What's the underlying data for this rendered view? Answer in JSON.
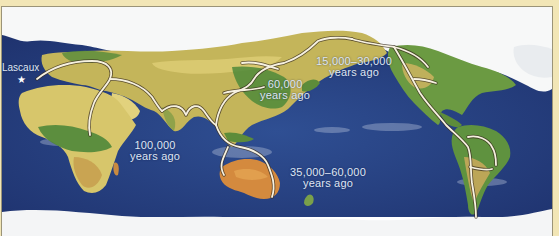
{
  "map": {
    "title": "Human migration routes world map",
    "colors": {
      "ocean": "#2a4585",
      "ocean_dark": "#1d3270",
      "ice": "#f7f8f8",
      "land_green": "#5f8f3a",
      "land_yellow": "#d9c56a",
      "land_orange": "#d98a3a",
      "route": "#f6f1e0",
      "route_outline": "#3a2e20",
      "frame": "#f2e6b6",
      "label": "#dfe6f4"
    },
    "site": {
      "name": "Lascaux",
      "marker": "star"
    },
    "labels": [
      {
        "id": "africa-to-asia",
        "line1": "100,000",
        "line2": "years ago"
      },
      {
        "id": "asia",
        "line1": "60,000",
        "line2": "years ago"
      },
      {
        "id": "americas",
        "line1": "15,000–30,000",
        "line2": "years ago"
      },
      {
        "id": "australia",
        "line1": "35,000–60,000",
        "line2": "years ago"
      }
    ]
  }
}
